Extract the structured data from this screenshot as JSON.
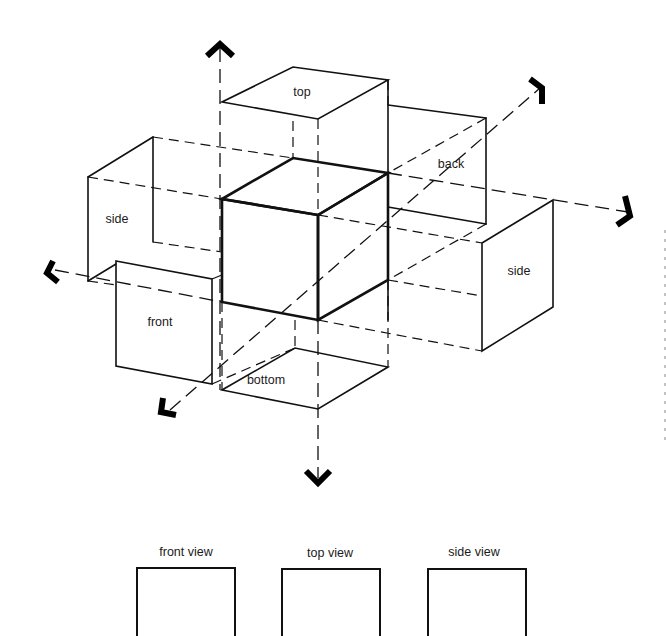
{
  "diagram": {
    "face_labels": {
      "top": "top",
      "back": "back",
      "side_left": "side",
      "side_right": "side",
      "front": "front",
      "bottom": "bottom"
    },
    "views": [
      {
        "label": "front view"
      },
      {
        "label": "top view"
      },
      {
        "label": "side view"
      }
    ],
    "colors": {
      "ink": "#111111",
      "background": "#ffffff"
    }
  }
}
